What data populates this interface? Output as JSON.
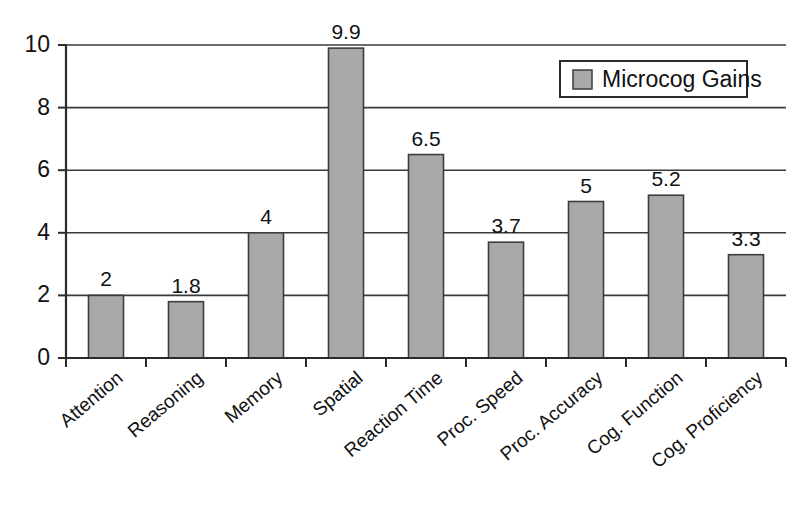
{
  "chart_data": {
    "type": "bar",
    "title": "",
    "subtitle": "",
    "xlabel": "",
    "ylabel": "",
    "ylim": [
      0,
      10
    ],
    "yticks": [
      0,
      2,
      4,
      6,
      8,
      10
    ],
    "ytick_labels": [
      "0",
      "2",
      "4",
      "6",
      "8",
      "10"
    ],
    "grid": "horizontal",
    "legend_position": "top-right",
    "categories": [
      "Attention",
      "Reasoning",
      "Memory",
      "Spatial",
      "Reaction Time",
      "Proc. Speed",
      "Proc. Accuracy",
      "Cog. Function",
      "Cog. Proficiency"
    ],
    "series": [
      {
        "name": "Microcog Gains",
        "color": "#a9a9a9",
        "values": [
          2,
          1.8,
          4,
          9.9,
          6.5,
          3.7,
          5,
          5.2,
          3.3
        ],
        "data_labels": [
          "2",
          "1.8",
          "4",
          "9.9",
          "6.5",
          "3.7",
          "5",
          "5.2",
          "3.3"
        ]
      }
    ]
  },
  "legend": {
    "entries": [
      {
        "label": "Microcog Gains",
        "swatch_color": "#a9a9a9"
      }
    ]
  },
  "colors": {
    "bar_fill": "#a9a9a9",
    "bar_stroke": "#3d3d3d",
    "axis": "#2b2b2b",
    "grid": "#3a3a3a",
    "text": "#111111",
    "background": "#ffffff"
  }
}
